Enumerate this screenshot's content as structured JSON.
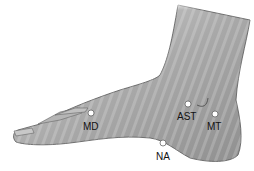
{
  "figure": {
    "points": [
      {
        "id": "MD",
        "label": "MD"
      },
      {
        "id": "AST",
        "label": "AST"
      },
      {
        "id": "MT",
        "label": "MT"
      },
      {
        "id": "NA",
        "label": "NA"
      }
    ]
  }
}
